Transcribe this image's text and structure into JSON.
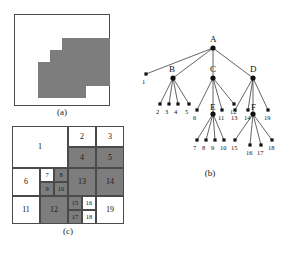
{
  "figure": {
    "panels": [
      {
        "id": "a",
        "caption": "(a)",
        "description": "binary raster image of a staircase shaped region"
      },
      {
        "id": "b",
        "caption": "(b)",
        "description": "quadtree representation of the image"
      },
      {
        "id": "c",
        "caption": "(c)",
        "description": "block decomposition of the image, blocks numbered in quadtree order"
      }
    ]
  },
  "panel_a": {
    "caption": "(a)",
    "fill_color": "#7d7d7d",
    "background_color": "#ffffff",
    "border_color": "#4a4a4a",
    "blocks": [
      {
        "x": 48,
        "y": 24,
        "w": 48,
        "h": 48
      },
      {
        "x": 36,
        "y": 36,
        "w": 12,
        "h": 36
      },
      {
        "x": 24,
        "y": 48,
        "w": 12,
        "h": 36
      },
      {
        "x": 24,
        "y": 72,
        "w": 36,
        "h": 12
      },
      {
        "x": 60,
        "y": 72,
        "w": 12,
        "h": 12
      }
    ]
  },
  "panel_b": {
    "caption": "(b)",
    "nodes": [
      {
        "id": "A",
        "label": "A",
        "x": 73,
        "y": 30,
        "label_dx": -3,
        "label_dy": -14
      },
      {
        "id": "B",
        "label": "B",
        "x": 33,
        "y": 60,
        "label_dx": -4,
        "label_dy": -14
      },
      {
        "id": "C",
        "label": "C",
        "x": 73,
        "y": 60,
        "label_dx": -3,
        "label_dy": -14
      },
      {
        "id": "D",
        "label": "D",
        "x": 113,
        "y": 60,
        "label_dx": -3,
        "label_dy": -14
      },
      {
        "id": "E",
        "label": "E",
        "x": 73,
        "y": 96,
        "label_dx": -3,
        "label_dy": -12
      },
      {
        "id": "F",
        "label": "F",
        "x": 113,
        "y": 96,
        "label_dx": -2,
        "label_dy": -12
      }
    ],
    "root_leaf": {
      "label": "1",
      "x": 2,
      "y": 60
    },
    "leaf_groups": [
      {
        "parent": "B",
        "leaves": [
          {
            "label": "2",
            "x": 16,
            "y": 90
          },
          {
            "label": "3",
            "x": 25,
            "y": 90
          },
          {
            "label": "4",
            "x": 34,
            "y": 90
          },
          {
            "label": "5",
            "x": 45,
            "y": 90
          }
        ]
      },
      {
        "parent": "C",
        "leaves": [
          {
            "label": "6",
            "x": 53,
            "y": 96
          },
          {
            "label": "11",
            "x": 78,
            "y": 96
          },
          {
            "label": "12",
            "x": 90,
            "y": 90
          }
        ]
      },
      {
        "parent": "E",
        "leaves": [
          {
            "label": "7",
            "x": 53,
            "y": 126
          },
          {
            "label": "8",
            "x": 62,
            "y": 126
          },
          {
            "label": "9",
            "x": 71,
            "y": 126
          },
          {
            "label": "10",
            "x": 80,
            "y": 126
          }
        ]
      },
      {
        "parent": "D",
        "leaves": [
          {
            "label": "13",
            "x": 91,
            "y": 96
          },
          {
            "label": "14",
            "x": 104,
            "y": 96
          },
          {
            "label": "19",
            "x": 124,
            "y": 96
          }
        ]
      },
      {
        "parent": "F",
        "leaves": [
          {
            "label": "15",
            "x": 91,
            "y": 126
          },
          {
            "label": "16",
            "x": 106,
            "y": 131
          },
          {
            "label": "17",
            "x": 117,
            "y": 131
          },
          {
            "label": "18",
            "x": 128,
            "y": 126
          }
        ]
      }
    ]
  },
  "panel_c": {
    "caption": "(c)",
    "white_color": "#ffffff",
    "gray_color": "#7d7d7d",
    "border_color": "#4a4a4a",
    "cells": [
      {
        "label": "1",
        "shade": "white",
        "x": 0,
        "y": 0,
        "w": 56,
        "h": 42
      },
      {
        "label": "2",
        "shade": "white",
        "x": 56,
        "y": 0,
        "w": 28,
        "h": 21
      },
      {
        "label": "3",
        "shade": "white",
        "x": 84,
        "y": 0,
        "w": 28,
        "h": 21
      },
      {
        "label": "4",
        "shade": "gray",
        "x": 56,
        "y": 21,
        "w": 28,
        "h": 21
      },
      {
        "label": "5",
        "shade": "gray",
        "x": 84,
        "y": 21,
        "w": 28,
        "h": 21
      },
      {
        "label": "6",
        "shade": "white",
        "x": 0,
        "y": 42,
        "w": 28,
        "h": 28
      },
      {
        "label": "7",
        "shade": "white",
        "x": 28,
        "y": 42,
        "w": 14,
        "h": 14
      },
      {
        "label": "8",
        "shade": "gray",
        "x": 42,
        "y": 42,
        "w": 14,
        "h": 14
      },
      {
        "label": "9",
        "shade": "gray",
        "x": 28,
        "y": 56,
        "w": 14,
        "h": 14
      },
      {
        "label": "10",
        "shade": "gray",
        "x": 42,
        "y": 56,
        "w": 14,
        "h": 14
      },
      {
        "label": "13",
        "shade": "gray",
        "x": 56,
        "y": 42,
        "w": 28,
        "h": 28
      },
      {
        "label": "14",
        "shade": "gray",
        "x": 84,
        "y": 42,
        "w": 28,
        "h": 28
      },
      {
        "label": "11",
        "shade": "white",
        "x": 0,
        "y": 70,
        "w": 28,
        "h": 28
      },
      {
        "label": "12",
        "shade": "gray",
        "x": 28,
        "y": 70,
        "w": 28,
        "h": 28
      },
      {
        "label": "15",
        "shade": "gray",
        "x": 56,
        "y": 70,
        "w": 14,
        "h": 14
      },
      {
        "label": "16",
        "shade": "white",
        "x": 70,
        "y": 70,
        "w": 14,
        "h": 14
      },
      {
        "label": "17",
        "shade": "gray",
        "x": 56,
        "y": 84,
        "w": 14,
        "h": 14
      },
      {
        "label": "18",
        "shade": "white",
        "x": 70,
        "y": 84,
        "w": 14,
        "h": 14
      },
      {
        "label": "19",
        "shade": "white",
        "x": 84,
        "y": 70,
        "w": 28,
        "h": 28
      }
    ]
  }
}
